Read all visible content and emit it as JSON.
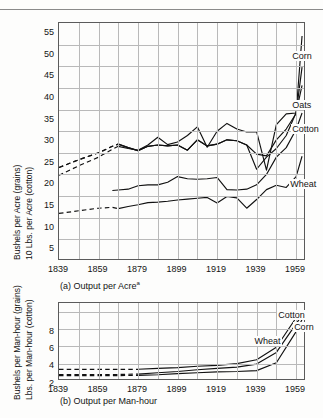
{
  "header": {
    "ghost_text": "",
    "note": ""
  },
  "chart_data": [
    {
      "id": "a",
      "type": "line",
      "title": "",
      "caption": "(a)  Output per Acre",
      "caption_superscript": "a",
      "xlabel": "",
      "ylabel_line1": "Bushels per Acre (grains)",
      "ylabel_line2": "10 Lbs. per Acre (cotton)",
      "xlim": [
        1839,
        1964
      ],
      "ylim": [
        0,
        55
      ],
      "ytick_values": [
        5,
        10,
        15,
        20,
        25,
        30,
        35,
        40,
        45,
        50,
        55
      ],
      "ytick_labels": [
        "5",
        "10",
        "15",
        "20",
        "25",
        "30",
        "35",
        "40",
        "45",
        "50",
        "55"
      ],
      "xtick_values": [
        1839,
        1859,
        1879,
        1899,
        1919,
        1939,
        1959
      ],
      "xtick_labels": [
        "1839",
        "1859",
        "1879",
        "1899",
        "1919",
        "1939",
        "1959"
      ],
      "minor_x_every": 10,
      "grid": true,
      "legend_position": "inline-right",
      "series": [
        {
          "name": "Corn",
          "label": "Corn",
          "label_x": 1957,
          "label_y": 47.0,
          "dashed_until": 1869,
          "x": [
            1839,
            1849,
            1859,
            1866,
            1869,
            1874,
            1879,
            1884,
            1889,
            1894,
            1899,
            1904,
            1909,
            1914,
            1919,
            1924,
            1929,
            1934,
            1939,
            1944,
            1949,
            1954,
            1959,
            1962
          ],
          "values": [
            19.8,
            22.0,
            24.0,
            25.8,
            26.5,
            26.0,
            25.6,
            26.8,
            28.6,
            26.9,
            27.5,
            29.0,
            31.0,
            26.3,
            30.0,
            31.8,
            30.5,
            29.8,
            29.9,
            21.0,
            31.5,
            34.0,
            34.2,
            52.0
          ]
        },
        {
          "name": "Oats",
          "label": "Oats",
          "label_x": 1957,
          "label_y": 35.6,
          "dashed_until": 1869,
          "x": [
            1839,
            1849,
            1859,
            1866,
            1869,
            1874,
            1879,
            1884,
            1889,
            1894,
            1899,
            1904,
            1909,
            1914,
            1919,
            1924,
            1929,
            1934,
            1939,
            1944,
            1949,
            1954,
            1959,
            1962
          ],
          "values": [
            21.6,
            23.4,
            25.0,
            26.5,
            27.0,
            26.2,
            25.5,
            26.5,
            26.8,
            26.6,
            26.8,
            25.6,
            28.0,
            26.6,
            27.0,
            28.0,
            27.8,
            26.8,
            24.7,
            24.3,
            28.0,
            30.5,
            34.1,
            44.8
          ]
        },
        {
          "name": "Cotton",
          "label": "Cotton",
          "label_x": 1957,
          "label_y": 30.0,
          "dashed_until": 1869,
          "x": [
            1839,
            1849,
            1859,
            1866,
            1869,
            1874,
            1879,
            1884,
            1889,
            1894,
            1899,
            1904,
            1909,
            1914,
            1919,
            1924,
            1929,
            1934,
            1939,
            1944,
            1949,
            1954,
            1959,
            1962
          ],
          "values": [
            21.6,
            23.4,
            25.0,
            26.5,
            27.0,
            26.2,
            25.5,
            26.5,
            26.8,
            26.6,
            26.8,
            25.6,
            28.0,
            26.6,
            27.0,
            28.0,
            27.8,
            26.8,
            21.2,
            24.0,
            26.0,
            29.0,
            34.3,
            40.6
          ]
        },
        {
          "name": "Wheat",
          "label": "Wheat",
          "label_x": 1956,
          "label_y": 17.4,
          "dashed_until": 1869,
          "x": [
            1839,
            1849,
            1859,
            1866,
            1869,
            1874,
            1879,
            1884,
            1889,
            1894,
            1899,
            1904,
            1909,
            1914,
            1919,
            1924,
            1929,
            1934,
            1939,
            1944,
            1949,
            1954,
            1959,
            1962
          ],
          "values": [
            11.0,
            11.6,
            12.2,
            12.4,
            12.1,
            12.6,
            13.0,
            13.5,
            13.6,
            13.8,
            14.1,
            14.3,
            14.5,
            14.7,
            13.4,
            14.9,
            14.6,
            12.2,
            14.2,
            16.5,
            17.5,
            17.0,
            19.5,
            24.2
          ]
        },
        {
          "name": "Corn (secondary mid band)",
          "label": "",
          "dashed_until": 0,
          "x": [
            1866,
            1869,
            1874,
            1879,
            1884,
            1889,
            1894,
            1899,
            1904,
            1909,
            1914,
            1919,
            1924,
            1929,
            1934,
            1939,
            1944,
            1949,
            1954,
            1959,
            1962
          ],
          "values": [
            16.3,
            16.4,
            16.6,
            17.4,
            17.6,
            17.6,
            18.2,
            19.5,
            19.0,
            18.9,
            19.0,
            19.3,
            16.5,
            16.4,
            16.6,
            17.6,
            20.0,
            24.0,
            26.2,
            30.4,
            34.2
          ]
        }
      ]
    },
    {
      "id": "b",
      "type": "line",
      "title": "",
      "caption": "(b) Output per Man-hour",
      "caption_superscript": "",
      "xlabel": "",
      "ylabel_line1": "Bushels per Man-hour (grains)",
      "ylabel_line2": "Lbs. per Man-hour (cotton)",
      "xlim": [
        1839,
        1964
      ],
      "ylim": [
        0,
        9
      ],
      "ytick_values": [
        2,
        4,
        6,
        8
      ],
      "ytick_labels": [
        "2",
        "4",
        "6",
        "8"
      ],
      "xtick_values": [
        1839,
        1859,
        1879,
        1899,
        1919,
        1939,
        1959
      ],
      "xtick_labels": [
        "1839",
        "1859",
        "1879",
        "1899",
        "1919",
        "1939",
        "1959"
      ],
      "minor_x_every": 10,
      "grid": true,
      "legend_position": "inline-right",
      "series": [
        {
          "name": "Cotton",
          "label": "Cotton",
          "label_x": 1950,
          "label_y": 7.4,
          "dashed_until": 1879,
          "x": [
            1839,
            1849,
            1859,
            1869,
            1879,
            1889,
            1899,
            1909,
            1919,
            1929,
            1939,
            1949,
            1959,
            1962
          ],
          "values": [
            1.35,
            1.35,
            1.35,
            1.35,
            1.35,
            1.45,
            1.55,
            1.7,
            1.8,
            2.0,
            2.45,
            3.9,
            7.3,
            8.1
          ]
        },
        {
          "name": "Wheat",
          "label": "Wheat",
          "label_x": 1938,
          "label_y": 4.4,
          "dashed_until": 1879,
          "x": [
            1839,
            1849,
            1859,
            1869,
            1879,
            1889,
            1899,
            1909,
            1919,
            1929,
            1939,
            1949,
            1959,
            1962
          ],
          "values": [
            0.75,
            0.75,
            0.75,
            0.75,
            0.8,
            0.95,
            1.1,
            1.3,
            1.45,
            1.6,
            1.95,
            3.3,
            6.6,
            7.6
          ]
        },
        {
          "name": "Corn",
          "label": "Corn",
          "label_x": 1958,
          "label_y": 6.0,
          "dashed_until": 1879,
          "x": [
            1839,
            1849,
            1859,
            1869,
            1879,
            1889,
            1899,
            1909,
            1919,
            1929,
            1939,
            1949,
            1959,
            1962
          ],
          "values": [
            0.62,
            0.62,
            0.62,
            0.62,
            0.65,
            0.72,
            0.85,
            0.95,
            1.05,
            1.1,
            1.2,
            2.1,
            5.7,
            7.1
          ]
        }
      ]
    }
  ]
}
